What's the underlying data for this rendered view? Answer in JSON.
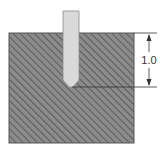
{
  "diagram": {
    "type": "engineering-section",
    "workpiece": {
      "fill_color": "#8a8a8a",
      "hatch_color": "#5a5a5a",
      "border_color": "#555555"
    },
    "tool": {
      "fill_color": "#d9d9d9",
      "border_color": "#888888"
    },
    "dimension": {
      "label": "1.0",
      "line_color": "#333333"
    }
  }
}
